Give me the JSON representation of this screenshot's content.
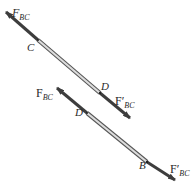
{
  "figure": {
    "colors": {
      "arrow": "#3d3d3d",
      "bar_fill": "#d8d8d8",
      "bar_edge": "#555555",
      "text": "#2a2a2a"
    },
    "members": [
      {
        "id": "segment-CD",
        "start_point": "C",
        "end_point": "D",
        "forces": [
          {
            "label_main": "F",
            "label_sub": "BC",
            "prime": false,
            "italic": true,
            "at": "C",
            "direction": "up-left"
          },
          {
            "label_main": "F",
            "label_sub": "BC",
            "prime": true,
            "italic": false,
            "at": "D",
            "direction": "down-right"
          }
        ]
      },
      {
        "id": "segment-DB",
        "start_point": "D",
        "end_point": "B",
        "forces": [
          {
            "label_main": "F",
            "label_sub": "BC",
            "prime": false,
            "italic": false,
            "at": "D",
            "direction": "up-left"
          },
          {
            "label_main": "F",
            "label_sub": "BC",
            "prime": true,
            "italic": false,
            "at": "B",
            "direction": "down-right"
          }
        ]
      }
    ],
    "labels": {
      "top_left_force": {
        "main": "F",
        "sub": "BC"
      },
      "point_C": "C",
      "point_D_top": "D",
      "top_right_force": {
        "main": "F′",
        "sub": "BC"
      },
      "mid_left_force": {
        "main": "F",
        "sub": "BC"
      },
      "point_D_bottom": "D",
      "point_B": "B",
      "bottom_right_force": {
        "main": "F′",
        "sub": "BC"
      }
    }
  }
}
